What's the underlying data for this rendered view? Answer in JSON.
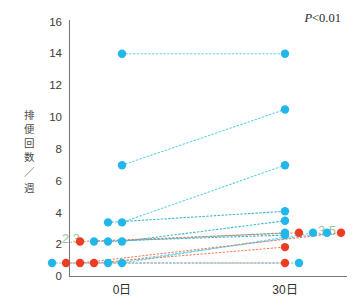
{
  "chart_data": {
    "type": "scatter",
    "title": "",
    "xlabel": "",
    "ylabel": "排便回数／週",
    "ylabel_chars": [
      "排",
      "便",
      "回",
      "数",
      "／",
      "週"
    ],
    "categories": [
      "0日",
      "30日"
    ],
    "ylim": [
      0,
      16
    ],
    "yticks": [
      0,
      2,
      4,
      6,
      8,
      10,
      12,
      14,
      16
    ],
    "ytick_labels": [
      "0",
      "2",
      "4",
      "6",
      "8",
      "10",
      "12",
      "14",
      "16"
    ],
    "grid": false,
    "legend": "none",
    "annotations": {
      "p_value_prefix": "P",
      "p_value_rest": "<0.01",
      "p_value_full": "P<0.01",
      "mean_day0": "2.3",
      "mean_day30": "3.5"
    },
    "colors": {
      "point_blue": "#22b7e8",
      "point_red": "#ec3c24",
      "link_blue": "#5fd0ef",
      "link_teal": "#3fb8c9",
      "link_red": "#ef7a5a",
      "mean_label_green": "#9dc49a",
      "axis": "#7a7a7a",
      "background": "#ffffff"
    },
    "series": [
      {
        "name": "subject-1",
        "x0": 14.0,
        "x30": 14.0,
        "color": "blue",
        "link": "blue"
      },
      {
        "name": "subject-2",
        "x0": 7.0,
        "x30": 10.5,
        "color": "blue",
        "link": "blue"
      },
      {
        "name": "subject-3",
        "x0": 3.4,
        "x30": 7.0,
        "color": "blue",
        "link": "blue"
      },
      {
        "name": "subject-4",
        "x0": 3.4,
        "x30": 4.1,
        "color": "blue",
        "link": "teal"
      },
      {
        "name": "subject-5",
        "x0": 2.2,
        "x30": 3.5,
        "color": "blue",
        "link": "teal"
      },
      {
        "name": "subject-6",
        "x0": 2.2,
        "x30": 2.75,
        "color": "blue",
        "link": "teal"
      },
      {
        "name": "subject-7",
        "x0": 2.2,
        "x30": 2.6,
        "color": "blue",
        "link": "teal"
      },
      {
        "name": "subject-8",
        "x0": 2.2,
        "x30": 2.75,
        "color": "red",
        "link": "red"
      },
      {
        "name": "subject-9",
        "x0": 0.85,
        "x30": 2.75,
        "color": "blue",
        "link": "blue"
      },
      {
        "name": "subject-10",
        "x0": 0.85,
        "x30": 2.75,
        "color": "blue",
        "link": "blue"
      },
      {
        "name": "subject-11",
        "x0": 0.85,
        "x30": 1.85,
        "color": "red",
        "link": "red"
      },
      {
        "name": "subject-12",
        "x0": 0.85,
        "x30": 2.75,
        "color": "red",
        "link": "red"
      },
      {
        "name": "subject-13",
        "x0": 0.85,
        "x30": 0.85,
        "color": "red",
        "link": "red"
      },
      {
        "name": "subject-14",
        "x0": 0.85,
        "x30": 0.85,
        "color": "blue",
        "link": "blue"
      }
    ],
    "left_points": [
      14.0,
      7.0,
      3.4,
      3.4,
      2.2,
      2.2,
      2.2,
      2.2,
      0.85,
      0.85,
      0.85,
      0.85
    ],
    "right_points": [
      14.0,
      10.5,
      7.0,
      4.1,
      3.5,
      2.75,
      2.75,
      2.75,
      2.75,
      2.6,
      1.85,
      0.85,
      0.85
    ]
  }
}
